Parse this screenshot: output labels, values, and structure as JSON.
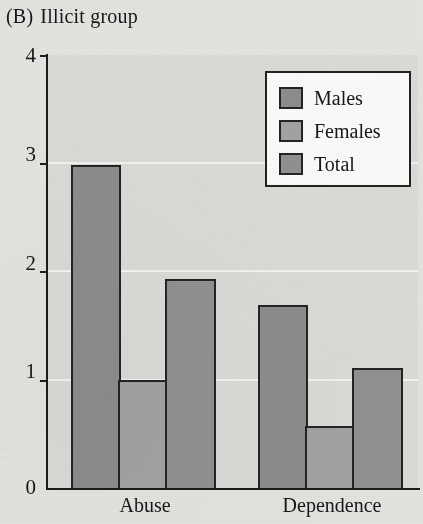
{
  "figure": {
    "panel_label": "(B)",
    "title": "Illicit group"
  },
  "chart_data": {
    "type": "bar",
    "xlabel": "",
    "ylabel": "",
    "categories": [
      "Abuse",
      "Dependence"
    ],
    "series": [
      {
        "name": "Males",
        "values": [
          2.98,
          1.69
        ],
        "color": "#8d8d8d"
      },
      {
        "name": "Females",
        "values": [
          1.0,
          0.57
        ],
        "color": "#a3a3a3"
      },
      {
        "name": "Total",
        "values": [
          1.93,
          1.11
        ],
        "color": "#919191"
      }
    ],
    "ylim": [
      0,
      4
    ],
    "yticks": [
      "0",
      "1",
      "2",
      "3",
      "4"
    ],
    "grid": true,
    "legend_position": "top-right",
    "legend_entries": [
      "Males",
      "Females",
      "Total"
    ]
  },
  "axes": {
    "y_tick_labels": [
      "4",
      "3",
      "2",
      "1",
      "0"
    ],
    "x_tick_labels": [
      "Abuse",
      "Dependence"
    ]
  },
  "legend": {
    "items": [
      {
        "label": "Males"
      },
      {
        "label": "Females"
      },
      {
        "label": "Total"
      }
    ]
  },
  "colors": {
    "plot_background": "#dcdbd8",
    "page_background": "#e6e4e1",
    "gridline": "#f4f3f1",
    "axis": "#1c1c1e",
    "bar_outline": "#242427"
  }
}
